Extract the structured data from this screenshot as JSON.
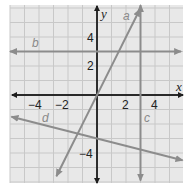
{
  "chart_data": {
    "type": "line",
    "title": "",
    "xlabel": "x",
    "ylabel": "y",
    "xlim": [
      -6.5,
      5.5
    ],
    "ylim": [
      -6.0,
      6.3
    ],
    "grid": true,
    "x_ticks": [
      -4,
      -2,
      2,
      4
    ],
    "y_ticks": [
      4,
      2,
      -4
    ],
    "series": [
      {
        "name": "a",
        "equation": "y = 2x",
        "points": [
          [
            -2.8,
            -5.6
          ],
          [
            2.95,
            5.9
          ]
        ]
      },
      {
        "name": "b",
        "equation": "y = 3",
        "points": [
          [
            -6,
            3
          ],
          [
            5.8,
            3
          ]
        ]
      },
      {
        "name": "c",
        "equation": "x = 3",
        "points": [
          [
            3,
            6.2
          ],
          [
            3,
            -5.9
          ]
        ]
      },
      {
        "name": "d",
        "equation": "y = -x/4 - 3",
        "points": [
          [
            -5.9,
            -1.5
          ],
          [
            5.9,
            -4.5
          ]
        ]
      }
    ]
  },
  "labels": {
    "x_axis": "x",
    "y_axis": "y",
    "line_a": "a",
    "line_b": "b",
    "line_c": "c",
    "line_d": "d",
    "tick_x_m4": "−4",
    "tick_x_m2": "−2",
    "tick_x_2": "2",
    "tick_x_4": "4",
    "tick_y_4": "4",
    "tick_y_2": "2",
    "tick_y_m4": "−4"
  },
  "colors": {
    "grid_bg": "#e8e8e8",
    "grid_line": "#c8c8c8",
    "axis": "#1e1e1e",
    "plot_line": "#8c8c8c"
  }
}
